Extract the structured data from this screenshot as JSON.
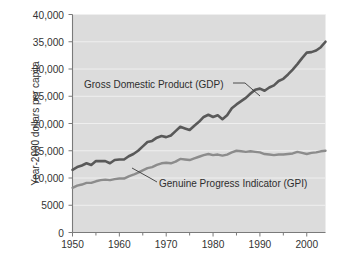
{
  "figure": {
    "background_color": "#ffffff",
    "plot_background_color": "#dcdcdc",
    "gridline_color": "#efefef",
    "axis_color": "#7a7a7a"
  },
  "chart_data": {
    "type": "line",
    "title": "",
    "xlabel": "",
    "ylabel": "Year-2000 dollars per capita",
    "xlim": [
      1950,
      2004
    ],
    "ylim": [
      0,
      40000
    ],
    "grid": true,
    "legend_position": "inline-annotations",
    "y_ticks": [
      0,
      5000,
      10000,
      15000,
      20000,
      25000,
      30000,
      35000,
      40000
    ],
    "y_tick_labels": [
      "0",
      "5000",
      "10,000",
      "15,000",
      "20,000",
      "25,000",
      "30,000",
      "35,000",
      "40,000"
    ],
    "x_ticks": [
      1950,
      1960,
      1970,
      1980,
      1990,
      2000
    ],
    "x_tick_labels": [
      "1950",
      "1960",
      "1970",
      "1980",
      "1990",
      "2000"
    ],
    "x_minor_ticks": [
      1955,
      1965,
      1975,
      1985,
      1995
    ],
    "annotations": [
      {
        "name": "gdp-annotation",
        "text": "Gross Domestic Product (GDP)",
        "points_to_series": "Gross Domestic Product (GDP)"
      },
      {
        "name": "gpi-annotation",
        "text": "Genuine Progress Indicator (GPI)",
        "points_to_series": "Genuine Progress Indicator (GPI)"
      }
    ],
    "x": [
      1950,
      1951,
      1952,
      1953,
      1954,
      1955,
      1956,
      1957,
      1958,
      1959,
      1960,
      1961,
      1962,
      1963,
      1964,
      1965,
      1966,
      1967,
      1968,
      1969,
      1970,
      1971,
      1972,
      1973,
      1974,
      1975,
      1976,
      1977,
      1978,
      1979,
      1980,
      1981,
      1982,
      1983,
      1984,
      1985,
      1986,
      1987,
      1988,
      1989,
      1990,
      1991,
      1992,
      1993,
      1994,
      1995,
      1996,
      1997,
      1998,
      1999,
      2000,
      2001,
      2002,
      2003,
      2004
    ],
    "series": [
      {
        "name": "Gross Domestic Product (GDP)",
        "color": "#595959",
        "line_width": 2.6,
        "values": [
          11500,
          12000,
          12300,
          12700,
          12400,
          13100,
          13100,
          13100,
          12700,
          13300,
          13400,
          13400,
          14000,
          14400,
          15000,
          15800,
          16600,
          16800,
          17400,
          17700,
          17500,
          17800,
          18600,
          19400,
          19100,
          18800,
          19600,
          20300,
          21200,
          21600,
          21200,
          21500,
          20800,
          21500,
          22800,
          23500,
          24100,
          24700,
          25500,
          26200,
          26400,
          26000,
          26600,
          27000,
          27800,
          28200,
          29000,
          29900,
          30900,
          32000,
          33000,
          33100,
          33400,
          34000,
          35000
        ],
        "end_value_note": "~37,000 at the right edge of the series"
      },
      {
        "name": "Genuine Progress Indicator (GPI)",
        "color": "#8c8c8c",
        "line_width": 2.4,
        "values": [
          8200,
          8600,
          8800,
          9100,
          9100,
          9400,
          9600,
          9700,
          9600,
          9800,
          9900,
          9900,
          10300,
          10600,
          11000,
          11400,
          11800,
          12000,
          12400,
          12700,
          12800,
          12700,
          13000,
          13500,
          13400,
          13300,
          13600,
          13900,
          14200,
          14400,
          14200,
          14300,
          14100,
          14300,
          14700,
          15000,
          14900,
          14800,
          14900,
          14800,
          14700,
          14400,
          14300,
          14200,
          14300,
          14300,
          14400,
          14500,
          14800,
          14600,
          14400,
          14600,
          14700,
          14900,
          15000
        ]
      }
    ]
  }
}
